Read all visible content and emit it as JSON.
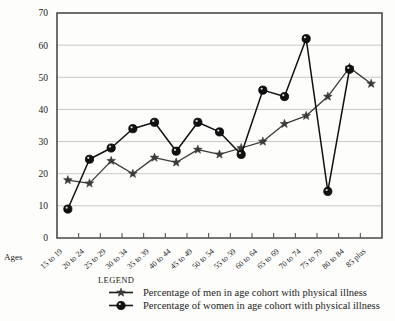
{
  "chart_data": {
    "type": "line",
    "title": "",
    "xlabel": "Ages",
    "ylabel": "",
    "ylim": [
      0,
      70
    ],
    "ytick_step": 10,
    "grid": true,
    "legend_position": "bottom",
    "legend_title": "LEGEND",
    "categories": [
      "15 to 19",
      "20 to 24",
      "25 to 29",
      "30 to 34",
      "35 to 39",
      "40 to 44",
      "45 to 49",
      "50 to 54",
      "55 to 59",
      "60 to 64",
      "65 to 69",
      "70 to 74",
      "75 to 79",
      "80 to 84",
      "85 plus"
    ],
    "yticks": [
      "0",
      "10",
      "20",
      "30",
      "40",
      "50",
      "60",
      "70"
    ],
    "series": [
      {
        "name": "Percentage of men in age cohort with physical illness",
        "marker": "star",
        "color": "#3a3a3a",
        "values": [
          18,
          17,
          24,
          20,
          25,
          23.5,
          27.5,
          26,
          28,
          30,
          35.5,
          38,
          44,
          53,
          48
        ]
      },
      {
        "name": "Percentage of women in age cohort with physical illness",
        "marker": "circle",
        "color": "#111111",
        "values": [
          9,
          24.5,
          28,
          34,
          36,
          27,
          36,
          33,
          26,
          46,
          44,
          62,
          14.5,
          52.5,
          null
        ]
      }
    ]
  },
  "axis": {
    "ages_label": "Ages"
  },
  "legend": {
    "title": "LEGEND",
    "entries": [
      {
        "label": "Percentage of men in age cohort with physical illness",
        "marker": "star"
      },
      {
        "label": "Percentage of women in age cohort with physical illness",
        "marker": "circle"
      }
    ]
  },
  "colors": {
    "grid": "#c9c9c9",
    "axis": "#4a4a4a",
    "men": "#3a3a3a",
    "women": "#111111",
    "background": "#fdfdfb"
  }
}
